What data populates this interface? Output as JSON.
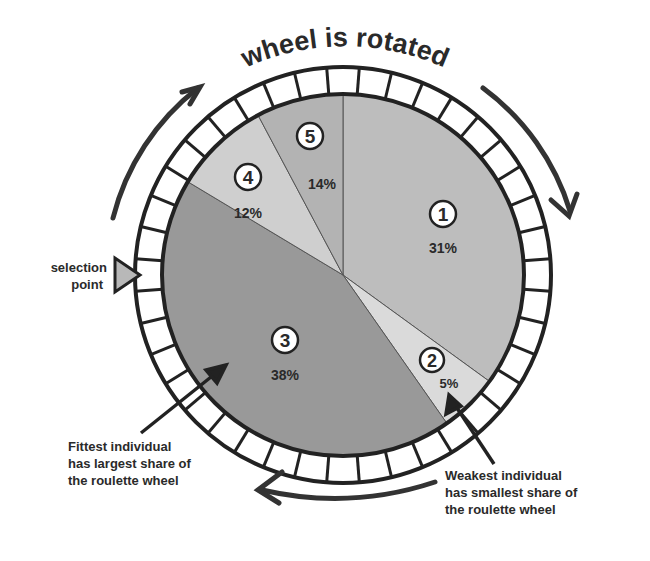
{
  "title": "wheel is rotated",
  "selection_point": {
    "line1": "selection",
    "line2": "point"
  },
  "fittest_note": [
    "Fittest individual",
    "has largest share of",
    "the roulette wheel"
  ],
  "weakest_note": [
    "Weakest individual",
    "has smallest share of",
    "the roulette wheel"
  ],
  "slices": [
    {
      "id": "1",
      "percent": "31%",
      "color": "#bdbdbd"
    },
    {
      "id": "2",
      "percent": "5%",
      "color": "#dadada"
    },
    {
      "id": "3",
      "percent": "38%",
      "color": "#999999"
    },
    {
      "id": "4",
      "percent": "12%",
      "color": "#cfcfcf"
    },
    {
      "id": "5",
      "percent": "14%",
      "color": "#b3b3b3"
    }
  ],
  "colors": {
    "ring_fill": "#ffffff",
    "stroke": "#222222",
    "pointer": "#b0b0b0"
  }
}
